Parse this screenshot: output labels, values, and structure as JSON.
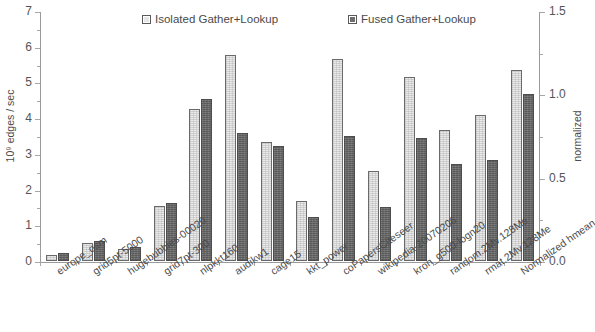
{
  "legend": {
    "items": [
      {
        "label": "Isolated Gather+Lookup",
        "swatch": "isolated",
        "color": "#eaeaea"
      },
      {
        "label": "Fused Gather+Lookup",
        "swatch": "fused",
        "color": "#707070"
      }
    ]
  },
  "axes": {
    "left_title": "10⁹ edges / sec",
    "right_title": "normalized",
    "left_ticks": [
      "0",
      "1",
      "2",
      "3",
      "4",
      "5",
      "6",
      "7"
    ],
    "right_ticks": [
      "0.0",
      "0.5",
      "1.0",
      "1.5"
    ]
  },
  "chart_data": {
    "type": "bar",
    "title": "",
    "xlabel": "",
    "ylabel": "10⁹ edges / sec",
    "y2label": "normalized",
    "ylim": [
      0,
      7
    ],
    "y2lim": [
      0,
      1.5
    ],
    "grid": false,
    "legend_position": "top",
    "categories": [
      "europe_osm",
      "grid5pt-5000",
      "hugebubbles-00020",
      "grid7pt-300",
      "nlpkkt160",
      "audikw1",
      "cage15",
      "kkt_power",
      "coPapersCiteseer",
      "wikipedia-20070206",
      "kron_g500-logn20",
      "random.2Mv.128Me",
      "rmat.2Mv.128Me",
      "Normalized hmean"
    ],
    "series": [
      {
        "name": "Isolated Gather+Lookup",
        "color": "#eaeaea",
        "values": [
          0.18,
          0.5,
          0.33,
          1.55,
          4.25,
          5.78,
          3.33,
          1.68,
          5.65,
          2.53,
          5.15,
          3.68,
          4.08,
          5.35
        ]
      },
      {
        "name": "Fused Gather+Lookup",
        "color": "#707070",
        "values": [
          0.23,
          0.57,
          0.4,
          1.62,
          4.55,
          3.58,
          3.22,
          1.22,
          3.5,
          1.5,
          3.45,
          2.73,
          2.82,
          4.67
        ]
      }
    ]
  }
}
